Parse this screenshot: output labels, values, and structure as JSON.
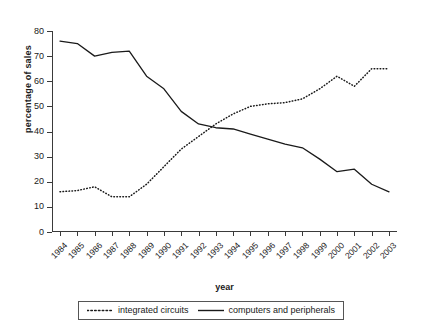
{
  "chart_data": {
    "type": "line",
    "title": "",
    "xlabel": "year",
    "ylabel": "percentage of sales",
    "ylim": [
      0,
      80
    ],
    "yticks": [
      0,
      10,
      20,
      30,
      40,
      50,
      60,
      70,
      80
    ],
    "grid": false,
    "legend_position": "bottom",
    "categories": [
      "1984",
      "1985",
      "1986",
      "1987",
      "1988",
      "1989",
      "1990",
      "1991",
      "1992",
      "1993",
      "1994",
      "1995",
      "1996",
      "1997",
      "1998",
      "1999",
      "2000",
      "2001",
      "2002",
      "2003"
    ],
    "series": [
      {
        "name": "integrated circuits",
        "style": "dotted",
        "color": "#1a1a1a",
        "values": [
          16,
          16.5,
          18,
          14,
          14,
          19,
          26,
          33,
          38,
          43,
          47,
          50,
          51,
          51.5,
          53,
          57,
          62,
          58,
          65,
          65
        ]
      },
      {
        "name": "computers and peripherals",
        "style": "solid",
        "color": "#1a1a1a",
        "values": [
          76,
          75,
          70,
          71.5,
          72,
          62,
          57,
          48,
          43,
          41.5,
          41,
          39,
          37,
          35,
          33.5,
          29,
          24,
          25,
          19,
          16
        ]
      }
    ]
  },
  "legend": {
    "items": [
      {
        "label": "integrated circuits",
        "style": "dotted"
      },
      {
        "label": "computers and peripherals",
        "style": "solid"
      }
    ]
  }
}
